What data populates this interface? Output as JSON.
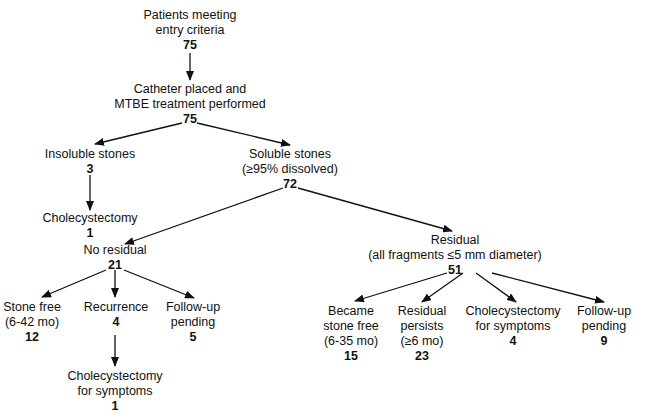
{
  "nodes": {
    "entry": {
      "lines": [
        "Patients meeting",
        "entry criteria"
      ],
      "n": "75"
    },
    "catheter": {
      "lines": [
        "Catheter placed and",
        "MTBE treatment performed"
      ],
      "n": "75"
    },
    "insoluble": {
      "lines": [
        "Insoluble stones"
      ],
      "n": "3"
    },
    "soluble": {
      "lines": [
        "Soluble stones",
        "(≥95% dissolved)"
      ],
      "n": "72"
    },
    "chole1": {
      "lines": [
        "Cholecystectomy"
      ],
      "n": "1"
    },
    "noresidual": {
      "lines": [
        "No residual"
      ],
      "n": "21"
    },
    "residual": {
      "lines": [
        "Residual",
        "(all fragments ≤5 mm diameter)"
      ],
      "n": "51"
    },
    "stonefree": {
      "lines": [
        "Stone free",
        "(6-42 mo)"
      ],
      "n": "12"
    },
    "recurrence": {
      "lines": [
        "Recurrence"
      ],
      "n": "4"
    },
    "followup1": {
      "lines": [
        "Follow-up",
        "pending"
      ],
      "n": "5"
    },
    "chole_sym1": {
      "lines": [
        "Cholecystectomy",
        "for symptoms"
      ],
      "n": "1"
    },
    "became_free": {
      "lines": [
        "Became",
        "stone free",
        "(6-35 mo)"
      ],
      "n": "15"
    },
    "res_persists": {
      "lines": [
        "Residual",
        "persists",
        "(≥6 mo)"
      ],
      "n": "23"
    },
    "chole_sym2": {
      "lines": [
        "Cholecystectomy",
        "for symptoms"
      ],
      "n": "4"
    },
    "followup2": {
      "lines": [
        "Follow-up",
        "pending"
      ],
      "n": "9"
    }
  },
  "edges": [
    [
      "entry",
      "catheter"
    ],
    [
      "catheter",
      "insoluble"
    ],
    [
      "catheter",
      "soluble"
    ],
    [
      "insoluble",
      "chole1"
    ],
    [
      "soluble",
      "noresidual"
    ],
    [
      "soluble",
      "residual"
    ],
    [
      "noresidual",
      "stonefree"
    ],
    [
      "noresidual",
      "recurrence"
    ],
    [
      "noresidual",
      "followup1"
    ],
    [
      "recurrence",
      "chole_sym1"
    ],
    [
      "residual",
      "became_free"
    ],
    [
      "residual",
      "res_persists"
    ],
    [
      "residual",
      "chole_sym2"
    ],
    [
      "residual",
      "followup2"
    ]
  ]
}
